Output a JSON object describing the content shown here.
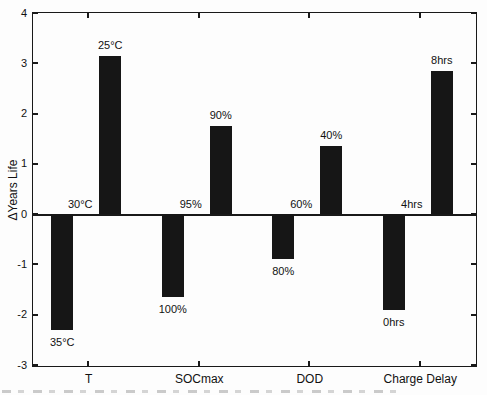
{
  "figure": {
    "ylabel": "ΔYears Life"
  },
  "chart_data": {
    "type": "bar",
    "title": "",
    "xlabel": "",
    "ylabel": "ΔYears Life",
    "ylim": [
      -3,
      4
    ],
    "yticks": [
      4,
      3,
      2,
      1,
      0,
      -1,
      -2,
      -3
    ],
    "grid": false,
    "legend": null,
    "box": true,
    "bar_color": "#161616",
    "axis_color": "#191919",
    "background_color": "#fdfdfd",
    "categories": [
      "T",
      "SOCmax",
      "DOD",
      "Charge Delay"
    ],
    "series": [
      {
        "name": "positive-change",
        "labels": [
          "25°C",
          "90%",
          "40%",
          "8hrs"
        ],
        "values": [
          3.15,
          1.75,
          1.35,
          2.85
        ]
      },
      {
        "name": "baseline-zero",
        "labels": [
          "30°C",
          "95%",
          "60%",
          "4hrs"
        ],
        "values": [
          0,
          0,
          0,
          0
        ]
      },
      {
        "name": "negative-change",
        "labels": [
          "35°C",
          "100%",
          "80%",
          "0hrs"
        ],
        "values": [
          -2.3,
          -1.65,
          -0.9,
          -1.9
        ]
      }
    ]
  }
}
